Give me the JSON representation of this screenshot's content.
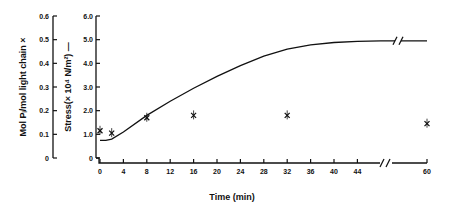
{
  "chart_data": {
    "type": "line",
    "title": "",
    "xlabel": "Time (min)",
    "x_ticks": [
      0,
      4,
      8,
      12,
      16,
      20,
      24,
      28,
      32,
      36,
      40,
      44,
      60
    ],
    "x_axis_break": "between 44 and 60",
    "y_axes": [
      {
        "label": "Mol Pi/mol light chain ×",
        "ticks": [
          "0",
          "0.1",
          "0.2",
          "0.3",
          "0.4",
          "0.5",
          "0.6"
        ],
        "ylim": [
          0,
          0.6
        ]
      },
      {
        "label": "Stress(× 10⁴ N/m²) —",
        "ticks": [
          "0",
          "1.0",
          "2.0",
          "3.0",
          "4.0",
          "5.0",
          "6.0"
        ],
        "ylim": [
          0,
          6.0
        ]
      }
    ],
    "series": [
      {
        "name": "Stress",
        "marker": "line",
        "axis": "right-inner",
        "x": [
          0,
          1,
          2,
          4,
          8,
          12,
          16,
          20,
          24,
          28,
          32,
          36,
          40,
          44,
          48,
          60
        ],
        "values": [
          0.75,
          0.75,
          0.8,
          1.1,
          1.8,
          2.4,
          2.95,
          3.45,
          3.9,
          4.3,
          4.6,
          4.78,
          4.88,
          4.93,
          4.95,
          4.95
        ]
      },
      {
        "name": "Phosphorylation (mol Pi/mol light chain)",
        "marker": "x",
        "axis": "left-outer",
        "x": [
          0,
          2,
          8,
          16,
          32,
          60
        ],
        "values": [
          0.115,
          0.105,
          0.17,
          0.18,
          0.18,
          0.145
        ]
      }
    ]
  }
}
